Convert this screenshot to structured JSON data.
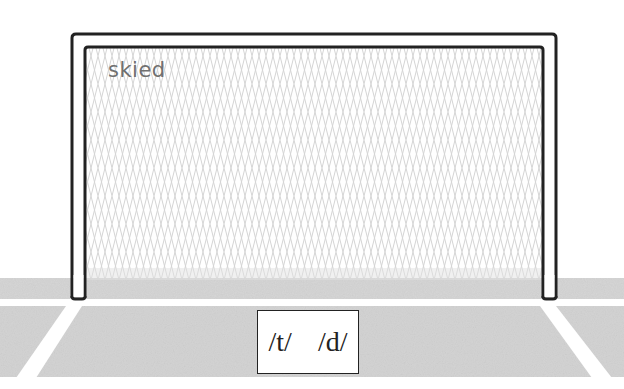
{
  "scene": {
    "word": "skied",
    "choices": "/t/  /d/",
    "colors": {
      "background": "#ffffff",
      "grass": "#d4d4d4",
      "field_line": "#ffffff",
      "goal_frame": "#222222",
      "net": "#cfcfcf",
      "word_text": "#707070"
    }
  }
}
